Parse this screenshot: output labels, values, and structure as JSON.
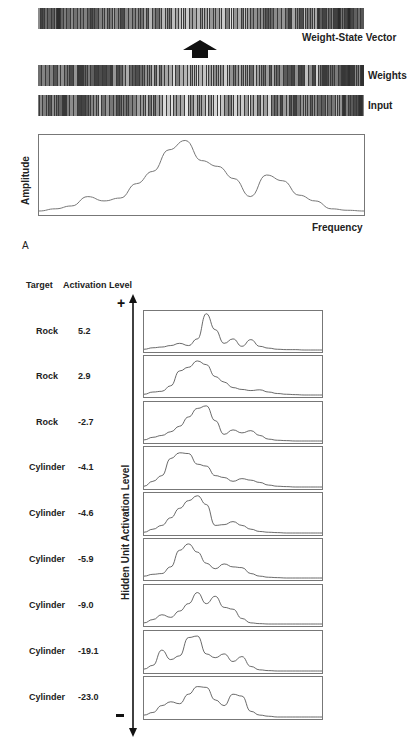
{
  "top": {
    "labels": {
      "weight_state_vector": "Weight-State Vector",
      "weights": "Weights",
      "input": "Input"
    },
    "arrow": "up-arrow-icon"
  },
  "spectrum": {
    "ylabel": "Amplitude",
    "xlabel": "Frequency",
    "panel_label": "A"
  },
  "hidden": {
    "header_target": "Target",
    "header_activation": "Activation Level",
    "axis_label": "Hidden Unit Activation Level",
    "plus": "+",
    "minus": "-",
    "rows": [
      {
        "target": "Rock",
        "activation": "5.2"
      },
      {
        "target": "Rock",
        "activation": "2.9"
      },
      {
        "target": "Rock",
        "activation": "-2.7"
      },
      {
        "target": "Cylinder",
        "activation": "-4.1"
      },
      {
        "target": "Cylinder",
        "activation": "-4.6"
      },
      {
        "target": "Cylinder",
        "activation": "-5.9"
      },
      {
        "target": "Cylinder",
        "activation": "-9.0"
      },
      {
        "target": "Cylinder",
        "activation": "-19.1"
      },
      {
        "target": "Cylinder",
        "activation": "-23.0"
      }
    ]
  },
  "chart_data": [
    {
      "type": "line",
      "title": "",
      "xlabel": "Frequency",
      "ylabel": "Amplitude",
      "grid": false,
      "x": [
        0,
        0.05,
        0.1,
        0.15,
        0.2,
        0.25,
        0.3,
        0.35,
        0.4,
        0.45,
        0.5,
        0.55,
        0.6,
        0.65,
        0.7,
        0.75,
        0.8,
        0.85,
        0.9,
        0.95,
        1.0
      ],
      "values": [
        0.0,
        0.03,
        0.07,
        0.2,
        0.14,
        0.18,
        0.38,
        0.55,
        0.85,
        0.98,
        0.7,
        0.62,
        0.45,
        0.2,
        0.5,
        0.42,
        0.22,
        0.14,
        0.03,
        0.01,
        0.0
      ]
    },
    {
      "type": "line",
      "title": "Input spectra ordered by hidden unit activation level",
      "xlabel": "",
      "ylabel": "Hidden Unit Activation Level",
      "x": [
        0,
        0.05,
        0.1,
        0.15,
        0.2,
        0.25,
        0.3,
        0.35,
        0.4,
        0.45,
        0.5,
        0.55,
        0.6,
        0.65,
        0.7,
        0.75,
        0.8,
        0.85,
        0.9,
        0.95,
        1.0
      ],
      "series": [
        {
          "name": "Rock 5.2",
          "values": [
            0.02,
            0.06,
            0.08,
            0.12,
            0.18,
            0.12,
            0.3,
            0.98,
            0.55,
            0.18,
            0.3,
            0.1,
            0.28,
            0.1,
            0.05,
            0.02,
            0.01,
            0.01,
            0.0,
            0.0,
            0.0
          ]
        },
        {
          "name": "Rock 2.9",
          "values": [
            0.02,
            0.08,
            0.1,
            0.25,
            0.65,
            0.75,
            0.92,
            0.82,
            0.5,
            0.35,
            0.2,
            0.15,
            0.12,
            0.14,
            0.08,
            0.04,
            0.02,
            0.01,
            0.0,
            0.0,
            0.0
          ]
        },
        {
          "name": "Rock -2.7",
          "values": [
            0.03,
            0.1,
            0.15,
            0.25,
            0.4,
            0.65,
            0.88,
            0.95,
            0.55,
            0.18,
            0.3,
            0.22,
            0.28,
            0.15,
            0.05,
            0.02,
            0.01,
            0.0,
            0.0,
            0.0,
            0.0
          ]
        },
        {
          "name": "Cylinder -4.1",
          "values": [
            0.02,
            0.15,
            0.3,
            0.75,
            0.9,
            0.88,
            0.6,
            0.55,
            0.3,
            0.25,
            0.15,
            0.22,
            0.18,
            0.12,
            0.05,
            0.02,
            0.01,
            0.0,
            0.0,
            0.0,
            0.0
          ]
        },
        {
          "name": "Cylinder -4.6",
          "values": [
            0.02,
            0.1,
            0.2,
            0.4,
            0.65,
            0.85,
            0.98,
            0.75,
            0.2,
            0.22,
            0.3,
            0.2,
            0.1,
            0.04,
            0.02,
            0.01,
            0.0,
            0.0,
            0.0,
            0.0,
            0.0
          ]
        },
        {
          "name": "Cylinder -5.9",
          "values": [
            0.05,
            0.1,
            0.12,
            0.3,
            0.75,
            0.92,
            0.7,
            0.4,
            0.25,
            0.38,
            0.3,
            0.28,
            0.12,
            0.05,
            0.02,
            0.01,
            0.0,
            0.0,
            0.0,
            0.0,
            0.0
          ]
        },
        {
          "name": "Cylinder -9.0",
          "values": [
            0.03,
            0.12,
            0.25,
            0.18,
            0.35,
            0.55,
            0.85,
            0.55,
            0.75,
            0.45,
            0.4,
            0.15,
            0.03,
            0.01,
            0.0,
            0.0,
            0.0,
            0.0,
            0.0,
            0.0,
            0.0
          ]
        },
        {
          "name": "Cylinder -19.1",
          "values": [
            0.05,
            0.15,
            0.55,
            0.3,
            0.4,
            0.88,
            0.92,
            0.45,
            0.35,
            0.45,
            0.25,
            0.38,
            0.12,
            0.03,
            0.01,
            0.0,
            0.0,
            0.0,
            0.0,
            0.0,
            0.0
          ]
        },
        {
          "name": "Cylinder -23.0",
          "values": [
            0.05,
            0.12,
            0.3,
            0.4,
            0.35,
            0.6,
            0.8,
            0.78,
            0.45,
            0.3,
            0.6,
            0.55,
            0.15,
            0.05,
            0.02,
            0.0,
            0.0,
            0.0,
            0.0,
            0.0,
            0.0
          ]
        }
      ]
    }
  ]
}
